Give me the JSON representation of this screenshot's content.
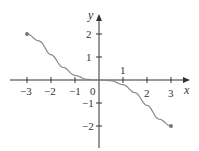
{
  "chart_data": {
    "type": "line",
    "title": "",
    "xlabel": "x",
    "ylabel": "y",
    "xlim": [
      -3.5,
      3.5
    ],
    "ylim": [
      -2.7,
      3.3
    ],
    "x_ticks": [
      -3,
      -2,
      -1,
      0,
      1,
      2,
      3
    ],
    "y_ticks": [
      -2,
      -1,
      1,
      2
    ],
    "x_tick_labels": [
      "−3",
      "−2",
      "−1",
      "0",
      "2",
      "3"
    ],
    "y_tick_labels": [
      "2",
      "1",
      "−1",
      "−2"
    ],
    "annotation": "1",
    "series": [
      {
        "name": "f(x)",
        "x": [
          -3,
          -2.5,
          -2,
          -1.5,
          -1,
          -0.5,
          0,
          0.5,
          1,
          1.5,
          2,
          2.5,
          3
        ],
        "y": [
          2,
          1.7,
          1.1,
          0.55,
          0.2,
          0.03,
          0,
          -0.03,
          -0.2,
          -0.55,
          -1.1,
          -1.7,
          -2
        ],
        "endpoints": [
          [
            -3,
            2
          ],
          [
            3,
            -2
          ]
        ]
      }
    ],
    "grid": false,
    "color": "#888888"
  },
  "labels": {
    "x_axis": "x",
    "y_axis": "y",
    "x_ticks": {
      "m3": "−3",
      "m2": "−2",
      "m1": "−1",
      "zero": "0",
      "two": "2",
      "three": "3"
    },
    "y_ticks": {
      "two": "2",
      "one": "1",
      "m1": "−1",
      "m2": "−2"
    },
    "one_above": "1"
  }
}
